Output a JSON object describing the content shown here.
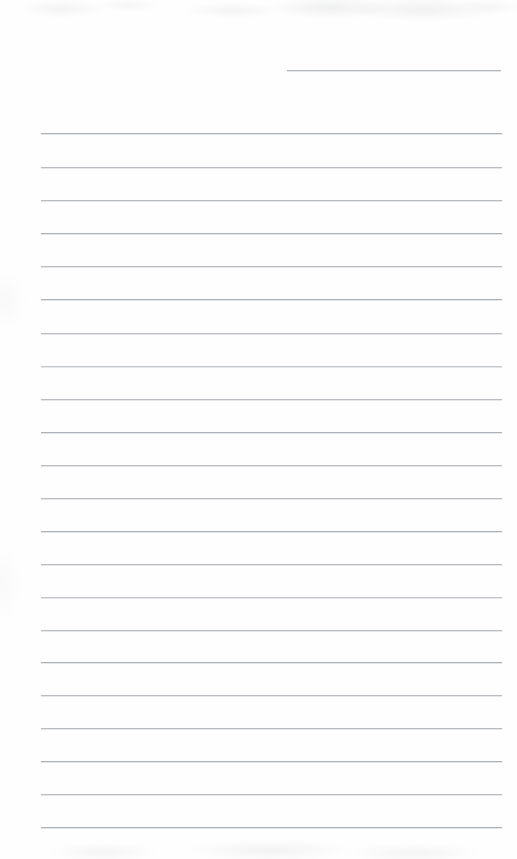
{
  "document": {
    "kind": "scanned-lined-notepaper",
    "title": "Blank ruled notepaper page",
    "page_width": 517,
    "page_height": 859,
    "background_color": "#fefefe",
    "rule_color": "#b9bdc2",
    "body_text": "",
    "rule_count_total": 23,
    "rule_spacing": 33.2
  },
  "rules": [
    {
      "id": "header-rule",
      "x": 287,
      "width": 214,
      "y": 70,
      "tone": "header-rule"
    },
    {
      "id": "rule-01",
      "x": 41,
      "width": 461,
      "y": 133,
      "tone": "dark"
    },
    {
      "id": "rule-02",
      "x": 41,
      "width": 461,
      "y": 167,
      "tone": ""
    },
    {
      "id": "rule-03",
      "x": 41,
      "width": 461,
      "y": 200,
      "tone": ""
    },
    {
      "id": "rule-04",
      "x": 41,
      "width": 461,
      "y": 233,
      "tone": "dark"
    },
    {
      "id": "rule-05",
      "x": 41,
      "width": 461,
      "y": 266,
      "tone": ""
    },
    {
      "id": "rule-06",
      "x": 41,
      "width": 461,
      "y": 299,
      "tone": "dark"
    },
    {
      "id": "rule-07",
      "x": 41,
      "width": 461,
      "y": 333,
      "tone": ""
    },
    {
      "id": "rule-08",
      "x": 41,
      "width": 461,
      "y": 366,
      "tone": "faint"
    },
    {
      "id": "rule-09",
      "x": 41,
      "width": 461,
      "y": 399,
      "tone": ""
    },
    {
      "id": "rule-10",
      "x": 41,
      "width": 461,
      "y": 432,
      "tone": "dark"
    },
    {
      "id": "rule-11",
      "x": 41,
      "width": 461,
      "y": 465,
      "tone": ""
    },
    {
      "id": "rule-12",
      "x": 41,
      "width": 461,
      "y": 498,
      "tone": ""
    },
    {
      "id": "rule-13",
      "x": 41,
      "width": 461,
      "y": 531,
      "tone": "dark"
    },
    {
      "id": "rule-14",
      "x": 41,
      "width": 461,
      "y": 564,
      "tone": ""
    },
    {
      "id": "rule-15",
      "x": 41,
      "width": 461,
      "y": 597,
      "tone": "faint"
    },
    {
      "id": "rule-16",
      "x": 41,
      "width": 461,
      "y": 630,
      "tone": ""
    },
    {
      "id": "rule-17",
      "x": 41,
      "width": 461,
      "y": 662,
      "tone": "dark"
    },
    {
      "id": "rule-18",
      "x": 41,
      "width": 461,
      "y": 695,
      "tone": ""
    },
    {
      "id": "rule-19",
      "x": 41,
      "width": 461,
      "y": 728,
      "tone": ""
    },
    {
      "id": "rule-20",
      "x": 41,
      "width": 461,
      "y": 761,
      "tone": "dark"
    },
    {
      "id": "rule-21",
      "x": 41,
      "width": 461,
      "y": 794,
      "tone": ""
    },
    {
      "id": "rule-22",
      "x": 41,
      "width": 461,
      "y": 827,
      "tone": "dark"
    }
  ]
}
